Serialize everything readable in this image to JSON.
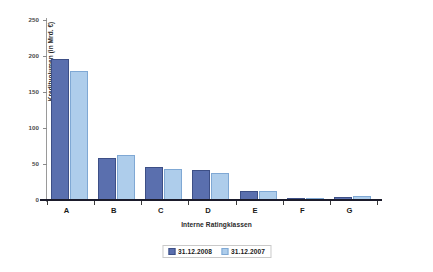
{
  "chart_data": {
    "type": "bar",
    "title": "",
    "xlabel": "Interne Ratingklassen",
    "ylabel": "Kreditvolumen (in Mrd. €)",
    "categories": [
      "A",
      "B",
      "C",
      "D",
      "E",
      "F",
      "G"
    ],
    "series": [
      {
        "name": "31.12.2008",
        "color": "#5a6fae",
        "values": [
          196,
          58,
          46,
          42,
          13,
          3,
          4
        ]
      },
      {
        "name": "31.12.2007",
        "color": "#aecdeb",
        "values": [
          179,
          63,
          43,
          37,
          12,
          3,
          5
        ]
      }
    ],
    "ylim": [
      0,
      250
    ],
    "yticks": [
      250,
      200,
      150,
      100,
      50,
      0
    ],
    "ytick_labels": [
      "250",
      "200",
      "150",
      "100",
      "50",
      "0"
    ],
    "grid": false,
    "legend_position": "bottom",
    "legend_entries": [
      "31.12.2008",
      "31.12.2007"
    ]
  },
  "colors": {
    "series_2008": "#5a6fae",
    "series_2007": "#aecdeb",
    "axis": "#1b1b2b",
    "background": "#ffffff"
  }
}
